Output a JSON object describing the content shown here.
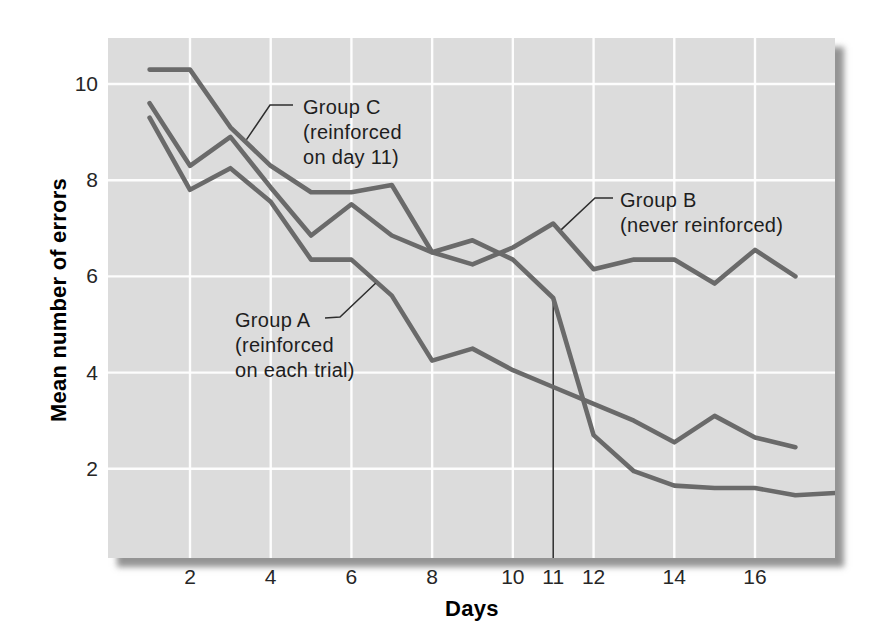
{
  "chart_data": {
    "type": "line",
    "title": "",
    "xlabel": "Days",
    "ylabel": "Mean number of errors",
    "x_range": [
      1,
      18
    ],
    "y_range": [
      0,
      11
    ],
    "x_tick_days": [
      2,
      4,
      6,
      8,
      10,
      11,
      12,
      14,
      16
    ],
    "x_tick_labels": [
      "2",
      "4",
      "6",
      "8",
      "10",
      "11",
      "12",
      "14",
      "16"
    ],
    "y_tick_values": [
      10,
      8,
      6,
      4,
      2
    ],
    "y_tick_labels": [
      "10",
      "8",
      "6",
      "4",
      "2"
    ],
    "v_gridline_days": [
      2,
      4,
      6,
      8,
      10,
      12,
      14,
      16
    ],
    "h_gridline_values": [
      2,
      4,
      6,
      8,
      10
    ],
    "legend_position": "inline-callouts",
    "grid": true,
    "series": [
      {
        "name": "Group A",
        "annotation": [
          "Group A",
          "(reinforced",
          "on each trial)"
        ],
        "days": [
          1,
          2,
          3,
          4,
          5,
          6,
          7,
          8,
          9,
          10,
          11,
          12,
          13,
          14,
          15,
          16,
          17
        ],
        "values": [
          9.3,
          7.8,
          8.25,
          7.55,
          6.35,
          6.35,
          5.6,
          4.25,
          4.5,
          4.05,
          3.7,
          3.35,
          3.0,
          2.55,
          3.1,
          2.65,
          2.45
        ]
      },
      {
        "name": "Group B",
        "annotation": [
          "Group B",
          "(never reinforced)"
        ],
        "days": [
          1,
          2,
          3,
          4,
          5,
          6,
          7,
          8,
          9,
          10,
          11,
          12,
          13,
          14,
          15,
          16,
          17
        ],
        "values": [
          9.6,
          8.3,
          8.9,
          7.85,
          6.85,
          7.5,
          6.85,
          6.5,
          6.25,
          6.6,
          7.1,
          6.15,
          6.35,
          6.35,
          5.85,
          6.55,
          6.0
        ]
      },
      {
        "name": "Group C",
        "annotation": [
          "Group C",
          "(reinforced",
          "on day 11)"
        ],
        "days": [
          1,
          2,
          3,
          4,
          5,
          6,
          7,
          8,
          9,
          10,
          11,
          12,
          13,
          14,
          15,
          16,
          17,
          18
        ],
        "values": [
          10.3,
          10.3,
          9.1,
          8.3,
          7.75,
          7.75,
          7.9,
          6.5,
          6.75,
          6.35,
          5.55,
          2.7,
          1.95,
          1.65,
          1.6,
          1.6,
          1.45,
          1.5
        ]
      }
    ],
    "event_marker": {
      "day": 11,
      "from_value": 5.55
    },
    "colors": {
      "line": "#6a6a6a",
      "plot_bg": "#dcdcdc",
      "grid": "#ffffff",
      "marker": "#2e2e2e",
      "text": "#1e1e1e"
    }
  }
}
